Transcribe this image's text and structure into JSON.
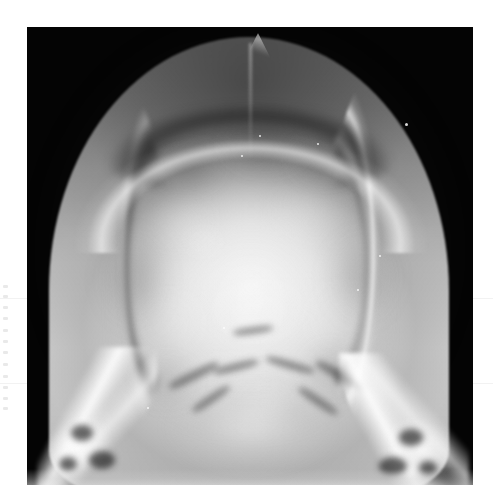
{
  "document": {
    "type": "scanned-radiograph-figure",
    "page_background": "#ffffff",
    "caption": "",
    "label": ""
  },
  "film": {
    "name": "skull-radiograph",
    "modality": "X-ray",
    "view": "AP / Towne projection",
    "anatomy": "skull (cranium)",
    "background_color": "#040404",
    "bounds_px": {
      "x": 27,
      "y": 27,
      "width": 446,
      "height": 458
    },
    "tone": {
      "background": "#040404",
      "bone_bright": "#f4f4f4",
      "vault_mid": "#c4c4c4",
      "vault_dark": "#5a5a5a",
      "rim_highlight": "#ffffff"
    }
  },
  "features": [
    {
      "name": "cranial-vault",
      "label": "Cranial vault"
    },
    {
      "name": "vertex-apex",
      "label": "Vertex with peaked apex"
    },
    {
      "name": "sagittal-suture",
      "label": "Sagittal suture"
    },
    {
      "name": "right-cortical-rim",
      "label": "Right outer table cortical rim"
    },
    {
      "name": "right-lucent-band",
      "label": "Right inner table lucent band"
    },
    {
      "name": "left-cortical-rim",
      "label": "Left outer table cortical rim"
    },
    {
      "name": "left-petrous-ridge",
      "label": "Left petrous ridge"
    },
    {
      "name": "right-petrous-ridge",
      "label": "Right petrous ridge"
    },
    {
      "name": "left-mastoid",
      "label": "Left mastoid air cells"
    },
    {
      "name": "right-mastoid",
      "label": "Right mastoid air cells"
    },
    {
      "name": "skull-base",
      "label": "Skull base / posterior fossa"
    }
  ],
  "margin_artifacts": {
    "name": "left-margin-bleed-through",
    "description": "faint illegible marks at the extreme left page margin",
    "legible_text": ""
  },
  "mottle_patches": [
    {
      "x": 118,
      "y": 168,
      "w": 78,
      "h": 62,
      "tone": "rgba(250,250,250,.26)",
      "blur": 9
    },
    {
      "x": 236,
      "y": 150,
      "w": 96,
      "h": 70,
      "tone": "rgba(252,252,252,.22)",
      "blur": 10
    },
    {
      "x": 170,
      "y": 238,
      "w": 120,
      "h": 86,
      "tone": "rgba(255,255,255,.24)",
      "blur": 12
    },
    {
      "x": 104,
      "y": 256,
      "w": 86,
      "h": 76,
      "tone": "rgba(244,244,244,.20)",
      "blur": 11
    },
    {
      "x": 264,
      "y": 250,
      "w": 92,
      "h": 82,
      "tone": "rgba(248,248,248,.20)",
      "blur": 11
    },
    {
      "x": 152,
      "y": 318,
      "w": 140,
      "h": 70,
      "tone": "rgba(255,255,255,.22)",
      "blur": 12
    },
    {
      "x": 196,
      "y": 92,
      "w": 86,
      "h": 52,
      "tone": "rgba(58,58,58,.40)",
      "blur": 10
    },
    {
      "x": 126,
      "y": 118,
      "w": 70,
      "h": 44,
      "tone": "rgba(70,70,70,.30)",
      "blur": 10
    },
    {
      "x": 262,
      "y": 110,
      "w": 74,
      "h": 46,
      "tone": "rgba(66,66,66,.32)",
      "blur": 10
    },
    {
      "x": 300,
      "y": 206,
      "w": 70,
      "h": 90,
      "tone": "rgba(96,96,96,.26)",
      "blur": 11
    },
    {
      "x": 74,
      "y": 204,
      "w": 66,
      "h": 96,
      "tone": "rgba(88,88,88,.28)",
      "blur": 11
    },
    {
      "x": 208,
      "y": 352,
      "w": 60,
      "h": 44,
      "tone": "rgba(255,255,255,.24)",
      "blur": 8
    },
    {
      "x": 150,
      "y": 196,
      "w": 54,
      "h": 40,
      "tone": "rgba(255,255,255,.18)",
      "blur": 8
    },
    {
      "x": 276,
      "y": 318,
      "w": 58,
      "h": 48,
      "tone": "rgba(120,120,120,.24)",
      "blur": 9
    },
    {
      "x": 108,
      "y": 330,
      "w": 62,
      "h": 50,
      "tone": "rgba(120,120,120,.22)",
      "blur": 9
    }
  ],
  "air_cells": [
    {
      "x": 44,
      "y": 398,
      "w": 22,
      "h": 16
    },
    {
      "x": 62,
      "y": 424,
      "w": 26,
      "h": 18
    },
    {
      "x": 32,
      "y": 430,
      "w": 18,
      "h": 14
    },
    {
      "x": 372,
      "y": 402,
      "w": 24,
      "h": 17
    },
    {
      "x": 352,
      "y": 430,
      "w": 28,
      "h": 18
    },
    {
      "x": 392,
      "y": 434,
      "w": 18,
      "h": 14
    }
  ],
  "base_streaks": [
    {
      "x": 140,
      "y": 344,
      "w": 54,
      "h": 9,
      "rot": -26
    },
    {
      "x": 186,
      "y": 336,
      "w": 46,
      "h": 8,
      "rot": -14
    },
    {
      "x": 238,
      "y": 334,
      "w": 50,
      "h": 8,
      "rot": 16
    },
    {
      "x": 286,
      "y": 344,
      "w": 56,
      "h": 9,
      "rot": 28
    },
    {
      "x": 162,
      "y": 368,
      "w": 44,
      "h": 8,
      "rot": -34
    },
    {
      "x": 268,
      "y": 370,
      "w": 46,
      "h": 8,
      "rot": 34
    },
    {
      "x": 206,
      "y": 300,
      "w": 40,
      "h": 7,
      "rot": -8
    }
  ],
  "specks": [
    {
      "x": 232,
      "y": 108,
      "s": 2
    },
    {
      "x": 214,
      "y": 128,
      "s": 2
    },
    {
      "x": 290,
      "y": 116,
      "s": 2
    },
    {
      "x": 378,
      "y": 96,
      "s": 3
    },
    {
      "x": 352,
      "y": 228,
      "s": 2
    },
    {
      "x": 196,
      "y": 300,
      "s": 2
    },
    {
      "x": 120,
      "y": 380,
      "s": 2
    },
    {
      "x": 330,
      "y": 262,
      "s": 2
    }
  ],
  "seams": [
    {
      "y": 298
    },
    {
      "y": 383
    }
  ],
  "margin_marks": [
    {
      "y": 0
    },
    {
      "y": 10
    },
    {
      "y": 21
    },
    {
      "y": 32
    },
    {
      "y": 44
    },
    {
      "y": 55
    },
    {
      "y": 66
    },
    {
      "y": 78
    },
    {
      "y": 90
    },
    {
      "y": 101
    },
    {
      "y": 112
    },
    {
      "y": 122
    }
  ]
}
